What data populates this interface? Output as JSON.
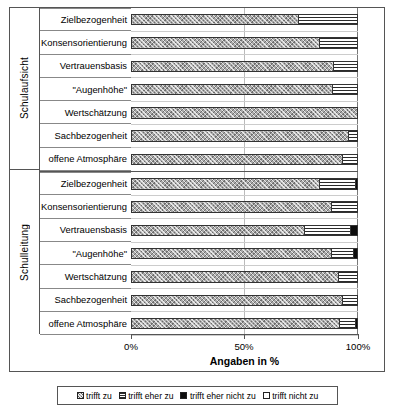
{
  "chart_data": {
    "type": "bar",
    "orientation": "horizontal",
    "stacked": true,
    "stack_normalized_percent": true,
    "title": "",
    "xlabel": "Angaben in %",
    "ylabel": "",
    "xlim": [
      0,
      100
    ],
    "xticks": [
      0,
      50,
      100
    ],
    "xticklabels": [
      "0%",
      "50%",
      "100%"
    ],
    "grid": true,
    "legend_position": "bottom",
    "legend": [
      "trifft zu",
      "trifft eher zu",
      "trifft eher nicht zu",
      "trifft  nicht zu"
    ],
    "series": [
      {
        "name": "trifft zu",
        "key": "s0"
      },
      {
        "name": "trifft eher zu",
        "key": "s1"
      },
      {
        "name": "trifft eher nicht zu",
        "key": "s2"
      },
      {
        "name": "trifft  nicht zu",
        "key": "s3"
      }
    ],
    "groups": [
      {
        "label": "Schulaufsicht",
        "categories": [
          "Zielbezogenheit",
          "Konsensorientierung",
          "Vertrauensbasis",
          "\"Augenhöhe\"",
          "Wertschätzung",
          "Sachbezogenheit",
          "offene Atmosphäre"
        ],
        "values": [
          [
            73.5,
            26.5,
            0.0,
            0.0
          ],
          [
            83.0,
            17.0,
            0.0,
            0.0
          ],
          [
            89.0,
            11.0,
            0.0,
            0.0
          ],
          [
            88.5,
            11.5,
            0.0,
            0.0
          ],
          [
            100.0,
            0.0,
            0.0,
            0.0
          ],
          [
            95.5,
            4.5,
            0.0,
            0.0
          ],
          [
            93.0,
            7.0,
            0.0,
            0.0
          ]
        ]
      },
      {
        "label": "Schulleitung",
        "categories": [
          "Zielbezogenheit",
          "Konsensorientierung",
          "Vertrauensbasis",
          "\"Augenhöhe\"",
          "Wertschätzung",
          "Sachbezogenheit",
          "offene Atmosphäre"
        ],
        "values": [
          [
            83.0,
            15.5,
            1.5,
            0.0
          ],
          [
            88.0,
            12.0,
            0.0,
            0.0
          ],
          [
            76.0,
            20.5,
            3.5,
            0.0
          ],
          [
            88.0,
            10.0,
            2.0,
            0.0
          ],
          [
            91.0,
            9.0,
            0.0,
            0.0
          ],
          [
            93.0,
            7.0,
            0.0,
            0.0
          ],
          [
            91.5,
            7.0,
            1.5,
            0.0
          ]
        ]
      }
    ]
  }
}
